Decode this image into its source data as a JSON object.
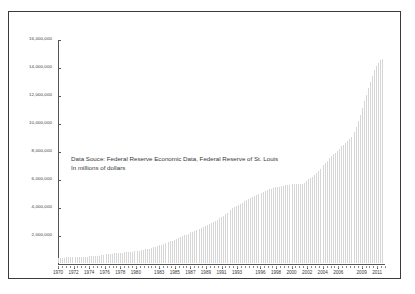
{
  "chart_data": {
    "type": "bar",
    "title": "",
    "xlabel": "",
    "ylabel": "",
    "ylim": [
      0,
      16000000
    ],
    "grid": false,
    "legend": "none",
    "annotations": [
      "Data Souce: Federal Reserve Economic Data, Federal Reserve of St. Louis",
      "In millions of dollars"
    ],
    "ytick_labels": [
      "16,000,000",
      "14,000,000",
      "12,000,000",
      "10,000,000",
      "8,000,000",
      "6,000,000",
      "4,000,000",
      "2,000,000"
    ],
    "ytick_values": [
      16000000,
      14000000,
      12000000,
      10000000,
      8000000,
      6000000,
      4000000,
      2000000
    ],
    "xtick_labels": [
      "1970",
      "1972",
      "1974",
      "1976",
      "1978",
      "1980",
      "1983",
      "1985",
      "1987",
      "1989",
      "1991",
      "1993",
      "1996",
      "1998",
      "2000",
      "2002",
      "2004",
      "2006",
      "2009",
      "2011"
    ],
    "xtick_values": [
      1970,
      1972,
      1974,
      1976,
      1978,
      1980,
      1983,
      1985,
      1987,
      1989,
      1991,
      1993,
      1996,
      1998,
      2000,
      2002,
      2004,
      2006,
      2009,
      2011
    ],
    "xlim": [
      1970,
      2012
    ],
    "x": [
      1970.0,
      1970.25,
      1970.5,
      1970.75,
      1971.0,
      1971.25,
      1971.5,
      1971.75,
      1972.0,
      1972.25,
      1972.5,
      1972.75,
      1973.0,
      1973.25,
      1973.5,
      1973.75,
      1974.0,
      1974.25,
      1974.5,
      1974.75,
      1975.0,
      1975.25,
      1975.5,
      1975.75,
      1976.0,
      1976.25,
      1976.5,
      1976.75,
      1977.0,
      1977.25,
      1977.5,
      1977.75,
      1978.0,
      1978.25,
      1978.5,
      1978.75,
      1979.0,
      1979.25,
      1979.5,
      1979.75,
      1980.0,
      1980.25,
      1980.5,
      1980.75,
      1981.0,
      1981.25,
      1981.5,
      1981.75,
      1982.0,
      1982.25,
      1982.5,
      1982.75,
      1983.0,
      1983.25,
      1983.5,
      1983.75,
      1984.0,
      1984.25,
      1984.5,
      1984.75,
      1985.0,
      1985.25,
      1985.5,
      1985.75,
      1986.0,
      1986.25,
      1986.5,
      1986.75,
      1987.0,
      1987.25,
      1987.5,
      1987.75,
      1988.0,
      1988.25,
      1988.5,
      1988.75,
      1989.0,
      1989.25,
      1989.5,
      1989.75,
      1990.0,
      1990.25,
      1990.5,
      1990.75,
      1991.0,
      1991.25,
      1991.5,
      1991.75,
      1992.0,
      1992.25,
      1992.5,
      1992.75,
      1993.0,
      1993.25,
      1993.5,
      1993.75,
      1994.0,
      1994.25,
      1994.5,
      1994.75,
      1995.0,
      1995.25,
      1995.5,
      1995.75,
      1996.0,
      1996.25,
      1996.5,
      1996.75,
      1997.0,
      1997.25,
      1997.5,
      1997.75,
      1998.0,
      1998.25,
      1998.5,
      1998.75,
      1999.0,
      1999.25,
      1999.5,
      1999.75,
      2000.0,
      2000.25,
      2000.5,
      2000.75,
      2001.0,
      2001.25,
      2001.5,
      2001.75,
      2002.0,
      2002.25,
      2002.5,
      2002.75,
      2003.0,
      2003.25,
      2003.5,
      2003.75,
      2004.0,
      2004.25,
      2004.5,
      2004.75,
      2005.0,
      2005.25,
      2005.5,
      2005.75,
      2006.0,
      2006.25,
      2006.5,
      2006.75,
      2007.0,
      2007.25,
      2007.5,
      2007.75,
      2008.0,
      2008.25,
      2008.5,
      2008.75,
      2009.0,
      2009.25,
      2009.5,
      2009.75,
      2010.0,
      2010.25,
      2010.5,
      2010.75,
      2011.0,
      2011.25,
      2011.5,
      2011.75
    ],
    "values": [
      372000,
      376000,
      381000,
      389000,
      398000,
      401000,
      406000,
      409000,
      424000,
      427000,
      430000,
      437000,
      450000,
      455000,
      458000,
      466000,
      478000,
      481000,
      487000,
      492000,
      512000,
      533000,
      551000,
      576000,
      606000,
      620000,
      634000,
      653000,
      674000,
      690000,
      702000,
      719000,
      739000,
      752000,
      763000,
      780000,
      800000,
      813000,
      826000,
      845000,
      863000,
      881000,
      900000,
      930000,
      960000,
      985000,
      1010000,
      1045000,
      1090000,
      1130000,
      1180000,
      1230000,
      1280000,
      1330000,
      1380000,
      1420000,
      1470000,
      1520000,
      1570000,
      1620000,
      1680000,
      1740000,
      1800000,
      1860000,
      1930000,
      1990000,
      2050000,
      2120000,
      2200000,
      2250000,
      2300000,
      2360000,
      2420000,
      2480000,
      2540000,
      2600000,
      2670000,
      2730000,
      2790000,
      2860000,
      2950000,
      3030000,
      3120000,
      3210000,
      3320000,
      3420000,
      3520000,
      3610000,
      3730000,
      3830000,
      3930000,
      4020000,
      4110000,
      4190000,
      4260000,
      4350000,
      4440000,
      4510000,
      4580000,
      4650000,
      4730000,
      4800000,
      4870000,
      4940000,
      4990000,
      5030000,
      5090000,
      5180000,
      5270000,
      5320000,
      5370000,
      5400000,
      5450000,
      5480000,
      5500000,
      5520000,
      5580000,
      5600000,
      5630000,
      5650000,
      5690000,
      5700000,
      5680000,
      5660000,
      5660000,
      5680000,
      5730000,
      5800000,
      5920000,
      6030000,
      6140000,
      6230000,
      6350000,
      6470000,
      6620000,
      6780000,
      6930000,
      7070000,
      7220000,
      7380000,
      7550000,
      7690000,
      7830000,
      7930000,
      8090000,
      8240000,
      8400000,
      8530000,
      8680000,
      8820000,
      8970000,
      9080000,
      9230000,
      9460000,
      9800000,
      10200000,
      10700000,
      11200000,
      11700000,
      12100000,
      12600000,
      13050000,
      13500000,
      13900000,
      14200000,
      14400000,
      14600000,
      14700000
    ]
  }
}
